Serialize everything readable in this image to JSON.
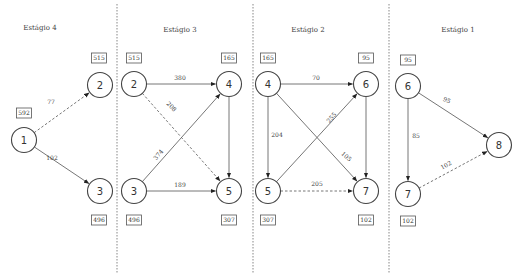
{
  "stages": [
    {
      "id": "stage4",
      "title": "Estágio 4",
      "x": 40,
      "y": 30
    },
    {
      "id": "stage3",
      "title": "Estágio 3",
      "x": 180,
      "y": 32
    },
    {
      "id": "stage2",
      "title": "Estágio 2",
      "x": 308,
      "y": 32
    },
    {
      "id": "stage1",
      "title": "Estágio 1",
      "x": 458,
      "y": 32
    }
  ],
  "dividers": [
    117,
    253,
    389
  ],
  "nodes": [
    {
      "id": "n1",
      "label": "1",
      "cx": 24,
      "cy": 140,
      "value": "592",
      "bx": 24,
      "by": 113
    },
    {
      "id": "n2a",
      "label": "2",
      "cx": 100,
      "cy": 85,
      "value": "515",
      "bx": 99,
      "by": 58
    },
    {
      "id": "n3a",
      "label": "3",
      "cx": 100,
      "cy": 191,
      "value": "496",
      "bx": 99,
      "by": 220
    },
    {
      "id": "n2b",
      "label": "2",
      "cx": 134,
      "cy": 84,
      "value": "515",
      "bx": 134,
      "by": 58
    },
    {
      "id": "n3b",
      "label": "3",
      "cx": 134,
      "cy": 191,
      "value": "496",
      "bx": 134,
      "by": 220
    },
    {
      "id": "n4a",
      "label": "4",
      "cx": 229,
      "cy": 84,
      "value": "165",
      "bx": 229,
      "by": 58
    },
    {
      "id": "n5a",
      "label": "5",
      "cx": 229,
      "cy": 191,
      "value": "307",
      "bx": 229,
      "by": 220
    },
    {
      "id": "n4b",
      "label": "4",
      "cx": 268,
      "cy": 84,
      "value": "165",
      "bx": 268,
      "by": 58
    },
    {
      "id": "n5b",
      "label": "5",
      "cx": 268,
      "cy": 191,
      "value": "307",
      "bx": 268,
      "by": 220
    },
    {
      "id": "n6a",
      "label": "6",
      "cx": 366,
      "cy": 84,
      "value": "95",
      "bx": 366,
      "by": 58
    },
    {
      "id": "n7a",
      "label": "7",
      "cx": 366,
      "cy": 191,
      "value": "102",
      "bx": 366,
      "by": 220
    },
    {
      "id": "n6b",
      "label": "6",
      "cx": 408,
      "cy": 86,
      "value": "95",
      "bx": 408,
      "by": 60
    },
    {
      "id": "n7b",
      "label": "7",
      "cx": 408,
      "cy": 194,
      "value": "102",
      "bx": 408,
      "by": 221
    },
    {
      "id": "n8",
      "label": "8",
      "cx": 499,
      "cy": 145,
      "value": "",
      "bx": 0,
      "by": 0
    }
  ],
  "edges": [
    {
      "from": "n1",
      "to": "n2a",
      "label": "77",
      "dashed": true,
      "lx": 51,
      "ly": 104,
      "rot": 0
    },
    {
      "from": "n1",
      "to": "n3a",
      "label": "102",
      "dashed": false,
      "lx": 52,
      "ly": 160,
      "rot": 0
    },
    {
      "from": "n2b",
      "to": "n4a",
      "label": "380",
      "dashed": false,
      "lx": 180,
      "ly": 80,
      "rot": 0
    },
    {
      "from": "n2b",
      "to": "n5a",
      "label": "208",
      "dashed": true,
      "lx": 170,
      "ly": 108,
      "rot": 45
    },
    {
      "from": "n3b",
      "to": "n4a",
      "label": "374",
      "dashed": false,
      "lx": 160,
      "ly": 156,
      "rot": -50
    },
    {
      "from": "n3b",
      "to": "n5a",
      "label": "189",
      "dashed": false,
      "lx": 180,
      "ly": 187,
      "rot": 0
    },
    {
      "from": "n4b",
      "to": "n6a",
      "label": "70",
      "dashed": false,
      "lx": 316,
      "ly": 80,
      "rot": 0
    },
    {
      "from": "n4b",
      "to": "n5b",
      "label": "204",
      "dashed": false,
      "lx": 277,
      "ly": 137,
      "rot": 0
    },
    {
      "from": "n4b",
      "to": "n7a",
      "label": "105",
      "dashed": false,
      "lx": 345,
      "ly": 158,
      "rot": 42
    },
    {
      "from": "n5b",
      "to": "n6a",
      "label": "255",
      "dashed": false,
      "lx": 333,
      "ly": 119,
      "rot": -48
    },
    {
      "from": "n5b",
      "to": "n7a",
      "label": "205",
      "dashed": true,
      "lx": 317,
      "ly": 186,
      "rot": 0
    },
    {
      "from": "n6a",
      "to": "n7a",
      "label": "",
      "dashed": false,
      "lx": 0,
      "ly": 0,
      "rot": 0
    },
    {
      "from": "n4a",
      "to": "n5a",
      "label": "",
      "dashed": false,
      "lx": 0,
      "ly": 0,
      "rot": 0
    },
    {
      "from": "n6b",
      "to": "n8",
      "label": "95",
      "dashed": false,
      "lx": 446,
      "ly": 102,
      "rot": 25
    },
    {
      "from": "n6b",
      "to": "n7b",
      "label": "85",
      "dashed": false,
      "lx": 416,
      "ly": 138,
      "rot": 0
    },
    {
      "from": "n7b",
      "to": "n8",
      "label": "102",
      "dashed": true,
      "lx": 447,
      "ly": 167,
      "rot": -28
    }
  ]
}
